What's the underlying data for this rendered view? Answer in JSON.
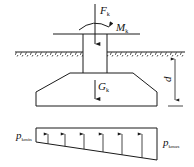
{
  "diagram": {
    "loads": {
      "axial_force": {
        "symbol": "F",
        "subscript": "k"
      },
      "moment": {
        "symbol": "M",
        "subscript": "k"
      },
      "self_weight": {
        "symbol": "G",
        "subscript": "k"
      }
    },
    "dimension": {
      "symbol": "d"
    },
    "pressure": {
      "min": {
        "symbol": "p",
        "subscript": "kmin"
      },
      "max": {
        "symbol": "p",
        "subscript": "kmax"
      },
      "arrow_count": 6
    },
    "colors": {
      "stroke": "#1a1a1a",
      "background": "#ffffff"
    }
  }
}
